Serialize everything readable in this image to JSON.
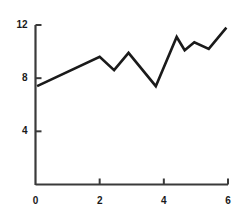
{
  "chart_data": {
    "type": "line",
    "title": "",
    "subtitle": "",
    "xlabel": "",
    "ylabel": "",
    "xlim": [
      0,
      6
    ],
    "ylim": [
      0,
      12
    ],
    "grid": false,
    "legend": null,
    "line_color": "#1a1a1a",
    "line_width": 2.6,
    "background_color": "#ffffff",
    "axis_color": "#3a3a3a",
    "x_ticks": [
      0,
      2,
      4,
      6
    ],
    "x_tick_labels": [
      "0",
      "2",
      "4",
      "6"
    ],
    "y_ticks": [
      4,
      8,
      12
    ],
    "y_tick_labels": [
      "4",
      "8",
      "12"
    ],
    "series": [
      {
        "name": "series-1",
        "x": [
          0.05,
          2.0,
          2.45,
          2.9,
          3.75,
          4.4,
          4.65,
          4.95,
          5.4,
          5.95
        ],
        "y": [
          7.4,
          9.6,
          8.6,
          9.9,
          7.4,
          11.1,
          10.1,
          10.7,
          10.2,
          11.8
        ]
      }
    ]
  },
  "axes": {
    "y_axis_name": "y-axis",
    "x_axis_name": "x-axis"
  }
}
